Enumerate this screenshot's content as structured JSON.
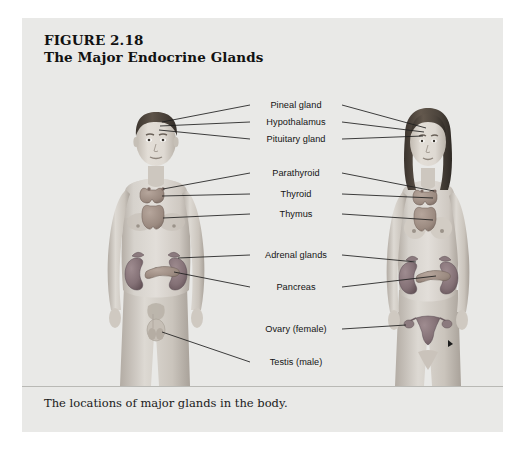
{
  "figure": {
    "number_line": "FIGURE 2.18",
    "title_line": "The Major Endocrine Glands",
    "caption": "The locations of major glands in the body."
  },
  "colors": {
    "panel_background": "#e9e9e7",
    "page_background": "#ffffff",
    "leader_line": "#1e1e1e",
    "label_text": "#141414",
    "title_text": "#111111",
    "rule": "#b9b9b5",
    "skin_light": "#dcd8d2",
    "skin_mid": "#c9c3bb",
    "skin_shadow": "#b0a9a0",
    "hair_dark": "#4a423c",
    "organ_mauve": "#8d7a7e",
    "organ_mauve_dark": "#6e5c61",
    "organ_tan": "#a8958c",
    "organ_gray": "#9a9490"
  },
  "labels": [
    {
      "id": "pineal-gland",
      "text": "Pineal gland",
      "x": 274,
      "y": 87
    },
    {
      "id": "hypothalamus",
      "text": "Hypothalamus",
      "x": 274,
      "y": 104
    },
    {
      "id": "pituitary-gland",
      "text": "Pituitary gland",
      "x": 274,
      "y": 121
    },
    {
      "id": "parathyroid",
      "text": "Parathyroid",
      "x": 274,
      "y": 155
    },
    {
      "id": "thyroid",
      "text": "Thyroid",
      "x": 274,
      "y": 176
    },
    {
      "id": "thymus",
      "text": "Thymus",
      "x": 274,
      "y": 196
    },
    {
      "id": "adrenal-glands",
      "text": "Adrenal glands",
      "x": 274,
      "y": 237
    },
    {
      "id": "pancreas",
      "text": "Pancreas",
      "x": 274,
      "y": 269
    },
    {
      "id": "ovary-female",
      "text": "Ovary (female)",
      "x": 274,
      "y": 311
    },
    {
      "id": "testis-male",
      "text": "Testis (male)",
      "x": 274,
      "y": 344
    }
  ],
  "figures": [
    {
      "id": "male-figure",
      "sex": "male",
      "side": "left"
    },
    {
      "id": "female-figure",
      "sex": "female",
      "side": "right"
    }
  ],
  "glands_depicted": [
    "pineal gland",
    "hypothalamus",
    "pituitary gland",
    "parathyroid",
    "thyroid",
    "thymus",
    "adrenal glands",
    "pancreas",
    "ovary",
    "testis"
  ]
}
